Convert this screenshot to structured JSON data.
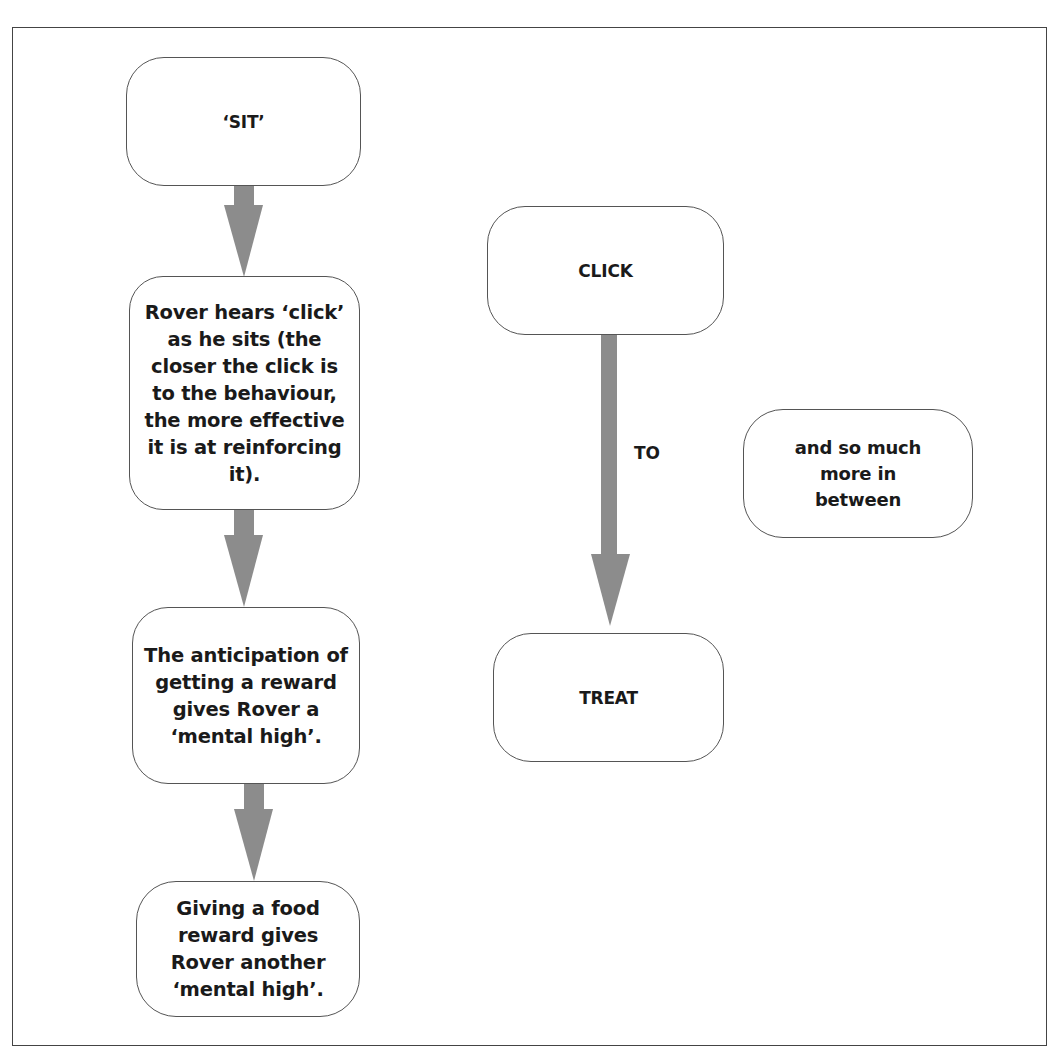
{
  "diagram": {
    "type": "flowchart",
    "colors": {
      "arrow": "#8c8c8c",
      "border": "#555555",
      "frame": "#444444",
      "text": "#1a1a1a",
      "background": "#ffffff"
    },
    "left_column": {
      "nodes": [
        {
          "id": "sit",
          "text": "‘SIT’"
        },
        {
          "id": "hears-click",
          "text": "Rover hears ‘click’ as he sits (the closer the click is to the behaviour, the more effective it is at reinforcing it)."
        },
        {
          "id": "anticipation",
          "text": "The anticipation of getting a reward gives Rover a ‘mental high’."
        },
        {
          "id": "food-reward",
          "text": "Giving a food reward gives Rover another ‘mental high’."
        }
      ],
      "arrows": [
        {
          "from": "sit",
          "to": "hears-click"
        },
        {
          "from": "hears-click",
          "to": "anticipation"
        },
        {
          "from": "anticipation",
          "to": "food-reward"
        }
      ]
    },
    "middle_column": {
      "nodes": [
        {
          "id": "click",
          "text": "CLICK"
        },
        {
          "id": "treat",
          "text": "TREAT"
        }
      ],
      "arrow_label": "TO",
      "arrows": [
        {
          "from": "click",
          "to": "treat",
          "label": "TO"
        }
      ]
    },
    "right_column": {
      "nodes": [
        {
          "id": "in-between",
          "text": "and so much more in between"
        }
      ]
    }
  }
}
